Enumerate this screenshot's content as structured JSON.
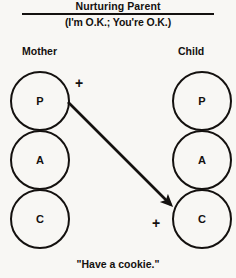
{
  "figure": {
    "title": "Nurturing Parent",
    "subtitle": "(I'm O.K.; You're O.K.)",
    "caption": "\"Have a cookie.\"",
    "ink_color": "#14110f",
    "background_color": "#f8f7f4"
  },
  "columns": {
    "left": {
      "heading": "Mother",
      "states": [
        {
          "code": "P",
          "name": "parent-ego-state"
        },
        {
          "code": "A",
          "name": "adult-ego-state"
        },
        {
          "code": "C",
          "name": "child-ego-state"
        }
      ]
    },
    "right": {
      "heading": "Child",
      "states": [
        {
          "code": "P",
          "name": "parent-ego-state"
        },
        {
          "code": "A",
          "name": "adult-ego-state"
        },
        {
          "code": "C",
          "name": "child-ego-state"
        }
      ]
    }
  },
  "transaction": {
    "source_marker": "+",
    "target_marker": "+",
    "from": "Mother P",
    "to": "Child C"
  }
}
